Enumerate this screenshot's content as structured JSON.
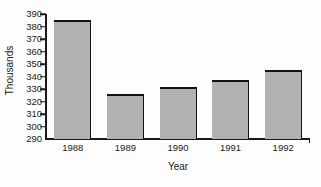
{
  "chart_data": {
    "type": "bar",
    "title": "",
    "subtitle": "",
    "xlabel": "Year",
    "ylabel": "Thousands",
    "categories": [
      "1988",
      "1989",
      "1990",
      "1991",
      "1992"
    ],
    "values": [
      385,
      326,
      332,
      337,
      345
    ],
    "ylim": [
      290,
      390
    ],
    "ytick_values": [
      290,
      300,
      310,
      320,
      330,
      340,
      350,
      360,
      370,
      380,
      390
    ],
    "ytick_labels": [
      "290",
      "300",
      "310",
      "320",
      "330",
      "340",
      "350",
      "360",
      "370",
      "380",
      "390"
    ],
    "grid": false,
    "legend": false,
    "legend_position": "none",
    "bar_color": "#b2b2b2",
    "bar_edge_color": "#121212",
    "axis_color": "#1a1a1a",
    "background_color": "#fdfdfd"
  }
}
